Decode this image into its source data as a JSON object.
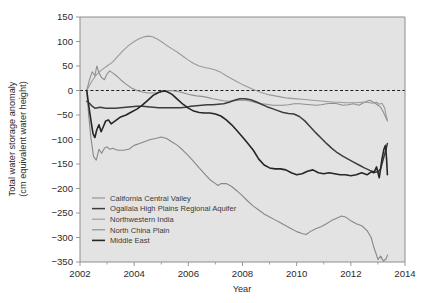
{
  "chart_data": {
    "type": "line",
    "title": "",
    "xlabel": "Year",
    "ylabel": "Total water storage anomaly (cm equivalent water height)",
    "ylabel_line1": "Total water storage anomaly",
    "ylabel_line2": "(cm equivalent water height)",
    "xlim": [
      2002,
      2014
    ],
    "ylim": [
      -350,
      150
    ],
    "xticks": [
      2002,
      2004,
      2006,
      2008,
      2010,
      2012,
      2014
    ],
    "xticklabels": [
      "2002",
      "2004",
      "2006",
      "2008",
      "2010",
      "2012",
      "2014"
    ],
    "xminorticks": [
      2003,
      2005,
      2007,
      2009,
      2011,
      2013
    ],
    "yticks": [
      150,
      100,
      50,
      0,
      -50,
      -100,
      -150,
      -200,
      -250,
      -300,
      -350
    ],
    "yticklabels": [
      "150",
      "100",
      "50",
      "0",
      "−50",
      "−100",
      "−150",
      "−200",
      "−250",
      "−300",
      "−350"
    ],
    "grid": false,
    "zero_reference_line": 0,
    "zero_line_style": "dashed",
    "legend_position": "lower left inside axes",
    "plot_background": "#e3e3e3",
    "frame_color": "#8d8d8d",
    "series": [
      {
        "name": "California Central Valley",
        "color": "#8f8f8f",
        "width": 1.1,
        "x": [
          2002.25,
          2002.35,
          2002.45,
          2002.55,
          2002.62,
          2002.7,
          2002.8,
          2002.9,
          2003.0,
          2003.1,
          2003.2,
          2003.35,
          2003.5,
          2003.7,
          2003.9,
          2004.1,
          2004.3,
          2004.5,
          2004.7,
          2004.9,
          2005.1,
          2005.3,
          2005.5,
          2005.7,
          2005.9,
          2006.1,
          2006.3,
          2006.5,
          2006.7,
          2006.9,
          2007.1,
          2007.3,
          2007.5,
          2007.7,
          2007.9,
          2008.1,
          2008.3,
          2008.5,
          2008.7,
          2008.9,
          2009.1,
          2009.3,
          2009.5,
          2009.7,
          2009.9,
          2010.1,
          2010.3,
          2010.5,
          2010.7,
          2010.9,
          2011.1,
          2011.3,
          2011.5,
          2011.7,
          2011.9,
          2012.1,
          2012.3,
          2012.5,
          2012.7,
          2012.9,
          2013.0,
          2013.1,
          2013.2,
          2013.3,
          2013.35
        ],
        "y": [
          0,
          22,
          38,
          30,
          50,
          36,
          26,
          22,
          34,
          40,
          36,
          30,
          22,
          13,
          5,
          0,
          -3,
          -5,
          -5,
          -4,
          -2,
          0,
          -1,
          -3,
          -6,
          -9,
          -11,
          -12,
          -14,
          -17,
          -19,
          -21,
          -22,
          -21,
          -20,
          -20,
          -22,
          -25,
          -27,
          -28,
          -30,
          -30,
          -30,
          -29,
          -27,
          -27,
          -28,
          -29,
          -30,
          -29,
          -27,
          -26,
          -27,
          -30,
          -29,
          -27,
          -30,
          -24,
          -20,
          -26,
          -30,
          -34,
          -44,
          -56,
          -62
        ]
      },
      {
        "name": "Ogallala High Plains Regional Aquifer",
        "color": "#3d3d3d",
        "width": 1.5,
        "x": [
          2002.25,
          2002.35,
          2002.45,
          2002.55,
          2002.65,
          2002.75,
          2002.85,
          2002.95,
          2003.1,
          2003.3,
          2003.5,
          2003.7,
          2003.9,
          2004.1,
          2004.3,
          2004.5,
          2004.7,
          2004.9,
          2005.1,
          2005.3,
          2005.5,
          2005.7,
          2005.9,
          2006.1,
          2006.3,
          2006.5,
          2006.7,
          2006.9,
          2007.1,
          2007.3,
          2007.5,
          2007.7,
          2007.9,
          2008.1,
          2008.3,
          2008.5,
          2008.7,
          2008.9,
          2009.1,
          2009.3,
          2009.5,
          2009.7,
          2009.9,
          2010.1,
          2010.3,
          2010.5,
          2010.7,
          2010.9,
          2011.1,
          2011.3,
          2011.5,
          2011.7,
          2011.9,
          2012.1,
          2012.3,
          2012.5,
          2012.7,
          2012.9,
          2013.0,
          2013.1,
          2013.2,
          2013.3,
          2013.35
        ],
        "y": [
          -22,
          -26,
          -32,
          -36,
          -35,
          -34,
          -35,
          -36,
          -36,
          -36,
          -35,
          -34,
          -33,
          -32,
          -32,
          -33,
          -34,
          -35,
          -35,
          -35,
          -35,
          -35,
          -34,
          -32,
          -31,
          -30,
          -29,
          -29,
          -28,
          -27,
          -24,
          -20,
          -17,
          -17,
          -19,
          -23,
          -28,
          -33,
          -37,
          -41,
          -45,
          -47,
          -48,
          -53,
          -62,
          -74,
          -86,
          -97,
          -108,
          -118,
          -127,
          -134,
          -140,
          -146,
          -152,
          -158,
          -163,
          -167,
          -166,
          -160,
          -140,
          -120,
          -108
        ]
      },
      {
        "name": "Northwestern India",
        "color": "#9a9a9a",
        "width": 1.1,
        "x": [
          2002.25,
          2002.35,
          2002.45,
          2002.6,
          2002.8,
          2003.0,
          2003.2,
          2003.4,
          2003.6,
          2003.8,
          2004.0,
          2004.2,
          2004.4,
          2004.55,
          2004.7,
          2004.85,
          2005.0,
          2005.2,
          2005.4,
          2005.6,
          2005.8,
          2006.0,
          2006.2,
          2006.4,
          2006.6,
          2006.8,
          2007.0,
          2007.2,
          2007.4,
          2007.6,
          2007.8,
          2008.0,
          2008.2,
          2008.4,
          2008.6,
          2008.8,
          2009.0,
          2009.2,
          2009.4,
          2009.6,
          2009.8,
          2010.0,
          2010.2,
          2010.4,
          2010.6,
          2010.8,
          2011.0,
          2011.2,
          2011.4,
          2011.6,
          2011.8,
          2012.0,
          2012.2,
          2012.4,
          2012.6,
          2012.8,
          2012.95,
          2013.05,
          2013.15,
          2013.25,
          2013.3,
          2013.35
        ],
        "y": [
          0,
          10,
          20,
          32,
          42,
          50,
          58,
          70,
          82,
          92,
          100,
          106,
          110,
          111,
          109,
          105,
          100,
          92,
          85,
          78,
          70,
          62,
          55,
          50,
          47,
          45,
          42,
          37,
          30,
          24,
          18,
          12,
          7,
          2,
          -2,
          -6,
          -9,
          -11,
          -13,
          -15,
          -16,
          -17,
          -18,
          -19,
          -20,
          -21,
          -22,
          -23,
          -24,
          -24,
          -25,
          -25,
          -25,
          -24,
          -24,
          -26,
          -24,
          -28,
          -26,
          -36,
          -50,
          -61
        ]
      },
      {
        "name": "North China Plain",
        "color": "#888888",
        "width": 1.1,
        "x": [
          2002.25,
          2002.32,
          2002.4,
          2002.5,
          2002.6,
          2002.7,
          2002.8,
          2002.9,
          2003.0,
          2003.1,
          2003.2,
          2003.4,
          2003.6,
          2003.8,
          2004.0,
          2004.2,
          2004.4,
          2004.6,
          2004.8,
          2005.0,
          2005.2,
          2005.4,
          2005.6,
          2005.8,
          2006.0,
          2006.2,
          2006.4,
          2006.6,
          2006.8,
          2007.0,
          2007.1,
          2007.2,
          2007.4,
          2007.6,
          2007.8,
          2008.0,
          2008.2,
          2008.4,
          2008.6,
          2008.8,
          2009.0,
          2009.2,
          2009.4,
          2009.6,
          2009.8,
          2010.0,
          2010.2,
          2010.35,
          2010.5,
          2010.7,
          2010.9,
          2011.1,
          2011.3,
          2011.5,
          2011.65,
          2011.8,
          2012.0,
          2012.2,
          2012.4,
          2012.6,
          2012.75,
          2012.85,
          2012.95,
          2013.0,
          2013.1,
          2013.2,
          2013.3,
          2013.35
        ],
        "y": [
          0,
          -50,
          -95,
          -135,
          -142,
          -120,
          -128,
          -118,
          -115,
          -120,
          -118,
          -122,
          -122,
          -120,
          -112,
          -108,
          -104,
          -100,
          -98,
          -95,
          -98,
          -105,
          -112,
          -122,
          -133,
          -145,
          -158,
          -170,
          -182,
          -190,
          -194,
          -190,
          -190,
          -196,
          -205,
          -215,
          -226,
          -236,
          -244,
          -252,
          -258,
          -264,
          -270,
          -276,
          -282,
          -288,
          -292,
          -294,
          -288,
          -282,
          -278,
          -272,
          -265,
          -260,
          -256,
          -258,
          -266,
          -272,
          -276,
          -286,
          -300,
          -320,
          -336,
          -345,
          -338,
          -348,
          -344,
          -336
        ]
      },
      {
        "name": "Middle East",
        "color": "#262626",
        "width": 1.6,
        "x": [
          2002.25,
          2002.32,
          2002.4,
          2002.48,
          2002.55,
          2002.62,
          2002.7,
          2002.78,
          2002.86,
          2002.95,
          2003.05,
          2003.15,
          2003.3,
          2003.5,
          2003.7,
          2003.9,
          2004.1,
          2004.3,
          2004.5,
          2004.7,
          2004.9,
          2005.05,
          2005.2,
          2005.4,
          2005.6,
          2005.8,
          2006.0,
          2006.2,
          2006.4,
          2006.6,
          2006.8,
          2007.0,
          2007.2,
          2007.4,
          2007.6,
          2007.8,
          2008.0,
          2008.2,
          2008.4,
          2008.6,
          2008.8,
          2009.0,
          2009.2,
          2009.4,
          2009.6,
          2009.8,
          2010.0,
          2010.2,
          2010.4,
          2010.6,
          2010.8,
          2011.0,
          2011.2,
          2011.4,
          2011.6,
          2011.8,
          2012.0,
          2012.2,
          2012.4,
          2012.6,
          2012.75,
          2012.85,
          2012.95,
          2013.05,
          2013.15,
          2013.22,
          2013.28,
          2013.32,
          2013.35
        ],
        "y": [
          0,
          -30,
          -60,
          -88,
          -96,
          -80,
          -70,
          -84,
          -74,
          -62,
          -60,
          -68,
          -62,
          -54,
          -50,
          -44,
          -38,
          -30,
          -20,
          -10,
          -4,
          -1,
          -2,
          -8,
          -18,
          -28,
          -36,
          -42,
          -45,
          -46,
          -46,
          -48,
          -52,
          -60,
          -70,
          -82,
          -95,
          -108,
          -122,
          -140,
          -152,
          -158,
          -160,
          -160,
          -162,
          -168,
          -172,
          -170,
          -165,
          -162,
          -168,
          -170,
          -168,
          -170,
          -172,
          -172,
          -174,
          -172,
          -168,
          -172,
          -166,
          -168,
          -156,
          -178,
          -140,
          -120,
          -112,
          -140,
          -172
        ]
      }
    ]
  },
  "legend": {
    "items": [
      {
        "label": "California Central Valley",
        "color": "#8f8f8f",
        "width": 1.1
      },
      {
        "label": "Ogallala High Plains Regional Aquifer",
        "color": "#3d3d3d",
        "width": 1.5
      },
      {
        "label": "Northwestern India",
        "color": "#9a9a9a",
        "width": 1.1
      },
      {
        "label": "North China Plain",
        "color": "#888888",
        "width": 1.1
      },
      {
        "label": "Middle East",
        "color": "#262626",
        "width": 1.6
      }
    ]
  }
}
